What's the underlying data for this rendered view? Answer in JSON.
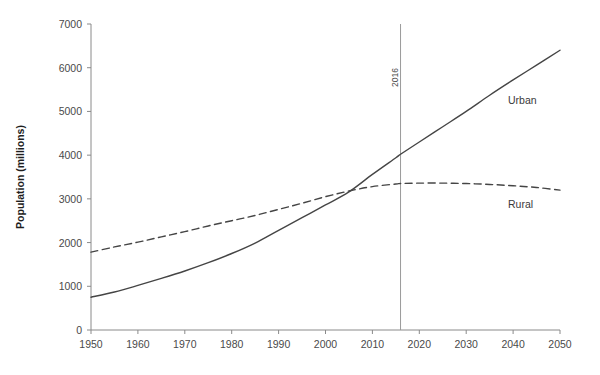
{
  "chart_data": {
    "type": "line",
    "title": "",
    "xlabel": "",
    "ylabel": "Population (millions)",
    "xlim": [
      1950,
      2050
    ],
    "ylim": [
      0,
      7000
    ],
    "grid": false,
    "legend_position": "inline-right",
    "x_ticks": [
      1950,
      1960,
      1970,
      1980,
      1990,
      2000,
      2010,
      2020,
      2030,
      2040,
      2050
    ],
    "y_ticks": [
      0,
      1000,
      2000,
      3000,
      4000,
      5000,
      6000,
      7000
    ],
    "x": [
      1950,
      1955,
      1960,
      1965,
      1970,
      1975,
      1980,
      1985,
      1990,
      1995,
      2000,
      2005,
      2010,
      2015,
      2016,
      2020,
      2025,
      2030,
      2035,
      2040,
      2045,
      2050
    ],
    "series": [
      {
        "name": "Urban",
        "style": "solid",
        "color": "#454545",
        "label": "Urban",
        "values": [
          750,
          870,
          1020,
          1180,
          1350,
          1540,
          1750,
          1990,
          2280,
          2570,
          2860,
          3160,
          3560,
          3940,
          4020,
          4300,
          4650,
          5000,
          5370,
          5720,
          6060,
          6400
        ]
      },
      {
        "name": "Rural",
        "style": "dashed",
        "color": "#454545",
        "label": "Rural",
        "values": [
          1780,
          1900,
          2010,
          2130,
          2250,
          2380,
          2500,
          2620,
          2760,
          2900,
          3050,
          3180,
          3280,
          3340,
          3350,
          3360,
          3360,
          3350,
          3330,
          3300,
          3260,
          3200
        ]
      }
    ],
    "annotations": [
      {
        "type": "vertical-line",
        "label": "2016",
        "x": 2016,
        "orientation": "rotated-90"
      }
    ]
  }
}
